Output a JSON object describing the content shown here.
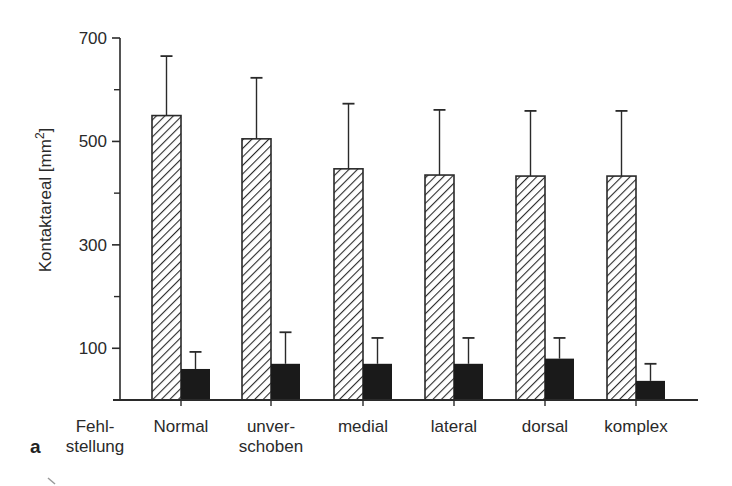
{
  "chart_data": {
    "type": "bar",
    "title": "",
    "panel_label": "a",
    "xlabel": "Fehlstellung",
    "xlabel_lines": [
      "Fehl-",
      "stellung"
    ],
    "ylabel": "Kontaktareal [mm²]",
    "ylabel_text": "Kontaktareal [mm",
    "ylabel_sup": "2",
    "ylabel_close": "]",
    "ylim": [
      0,
      700
    ],
    "yticks_labeled": [
      100,
      300,
      500,
      700
    ],
    "yticks_minor": [
      200,
      400,
      600
    ],
    "grid": false,
    "legend": null,
    "categories": [
      "Normal",
      "unverschoben",
      "medial",
      "lateral",
      "dorsal",
      "komplex"
    ],
    "category_labels": [
      [
        "Normal"
      ],
      [
        "unver-",
        "schoben"
      ],
      [
        "medial"
      ],
      [
        "lateral"
      ],
      [
        "dorsal"
      ],
      [
        "komplex"
      ]
    ],
    "series": [
      {
        "name": "hatched",
        "pattern": "diagonal-hatch",
        "values": [
          550,
          505,
          447,
          435,
          433,
          433
        ],
        "error_upper": [
          665,
          623,
          573,
          561,
          559,
          559
        ]
      },
      {
        "name": "solid",
        "pattern": "solid-black",
        "values": [
          60,
          70,
          70,
          70,
          80,
          37
        ],
        "error_upper": [
          93,
          131,
          120,
          120,
          120,
          70
        ]
      }
    ],
    "colors": {
      "hatched_fill": "#ffffff",
      "hatch_stroke": "#2a2a2a",
      "solid_fill": "#1a1a1a",
      "axis": "#2a2a2a"
    }
  }
}
